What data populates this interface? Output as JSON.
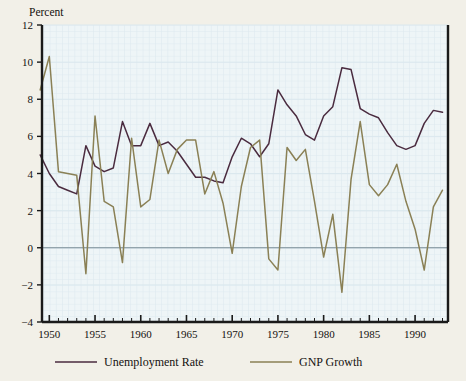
{
  "chart_data": {
    "type": "line",
    "title": "",
    "ylabel": "Percent",
    "xlabel": "",
    "ylim": [
      -4,
      12
    ],
    "xlim": [
      1949.2,
      1993.6
    ],
    "yticks": [
      -4,
      -2,
      0,
      2,
      4,
      6,
      8,
      10,
      12
    ],
    "ytick_labels": [
      "−4",
      "−2",
      "0",
      "2",
      "4",
      "6",
      "8",
      "10",
      "12"
    ],
    "xticks": [
      1950,
      1955,
      1960,
      1965,
      1970,
      1975,
      1980,
      1985,
      1990
    ],
    "xtick_labels": [
      "1950",
      "1955",
      "1960",
      "1965",
      "1970",
      "1975",
      "1980",
      "1985",
      "1990"
    ],
    "minor_xtick_step": 1,
    "grid": true,
    "grid_style": "fine light-blue mesh",
    "zero_line": true,
    "legend_position": "below-axes",
    "x": [
      1949,
      1950,
      1951,
      1952,
      1953,
      1954,
      1955,
      1956,
      1957,
      1958,
      1959,
      1960,
      1961,
      1962,
      1963,
      1964,
      1965,
      1966,
      1967,
      1968,
      1969,
      1970,
      1971,
      1972,
      1973,
      1974,
      1975,
      1976,
      1977,
      1978,
      1979,
      1980,
      1981,
      1982,
      1983,
      1984,
      1985,
      1986,
      1987,
      1988,
      1989,
      1990,
      1991,
      1992,
      1993
    ],
    "series": [
      {
        "name": "Unemployment Rate",
        "color": "#4a2b3f",
        "values": [
          5.0,
          4.0,
          3.3,
          3.1,
          2.9,
          5.5,
          4.4,
          4.1,
          4.3,
          6.8,
          5.5,
          5.5,
          6.7,
          5.5,
          5.7,
          5.2,
          4.5,
          3.8,
          3.8,
          3.6,
          3.5,
          4.9,
          5.9,
          5.6,
          4.9,
          5.6,
          8.5,
          7.7,
          7.1,
          6.1,
          5.8,
          7.1,
          7.6,
          9.7,
          9.6,
          7.5,
          7.2,
          7.0,
          6.2,
          5.5,
          5.3,
          5.5,
          6.7,
          7.4,
          7.3
        ]
      },
      {
        "name": "GNP Growth",
        "color": "#8a8055",
        "values": [
          8.5,
          10.3,
          4.1,
          4.0,
          3.9,
          -1.4,
          7.1,
          2.5,
          2.2,
          -0.8,
          5.9,
          2.2,
          2.6,
          5.8,
          4.0,
          5.3,
          5.8,
          5.8,
          2.9,
          4.1,
          2.4,
          -0.3,
          3.3,
          5.4,
          5.8,
          -0.6,
          -1.2,
          5.4,
          4.7,
          5.3,
          2.5,
          -0.5,
          1.8,
          -2.4,
          3.7,
          6.8,
          3.4,
          2.8,
          3.4,
          4.5,
          2.5,
          1.0,
          -1.2,
          2.2,
          3.1
        ]
      }
    ]
  },
  "legend": {
    "items": [
      {
        "label": "Unemployment Rate",
        "color": "#4a2b3f"
      },
      {
        "label": "GNP Growth",
        "color": "#8a8055"
      }
    ]
  },
  "colors": {
    "page_background": "#f2f0e8",
    "plot_background": "#eef5f7",
    "grid": "#dbe8ee",
    "axis": "#1a1a1a",
    "zero_line": "#7a8c96"
  }
}
